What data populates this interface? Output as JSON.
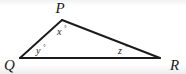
{
  "figure": {
    "background_color": "#ffffff",
    "stroke_color": "#1b1b1b",
    "vertices": [
      {
        "id": "P",
        "label": "P",
        "x": 62,
        "y": 20,
        "label_x": 60,
        "label_y": 13
      },
      {
        "id": "Q",
        "label": "Q",
        "x": 20,
        "y": 58,
        "label_x": 4,
        "label_y": 70
      },
      {
        "id": "R",
        "label": "R",
        "x": 160,
        "y": 58,
        "label_x": 170,
        "label_y": 70
      }
    ],
    "sides": [
      {
        "id": "PQ",
        "from": "P",
        "to": "Q"
      },
      {
        "id": "PR",
        "from": "P",
        "to": "R"
      },
      {
        "id": "QR",
        "from": "Q",
        "to": "R"
      }
    ],
    "angles": [
      {
        "id": "x",
        "at_vertex": "P",
        "label": "x",
        "unit": "°",
        "label_x": 57,
        "label_y": 35
      },
      {
        "id": "y",
        "at_vertex": "Q",
        "label": "y",
        "unit": "°",
        "label_x": 36,
        "label_y": 54
      },
      {
        "id": "z",
        "at_vertex": "R",
        "label": "z",
        "unit": "°",
        "label_x": 118,
        "label_y": 54
      }
    ]
  }
}
